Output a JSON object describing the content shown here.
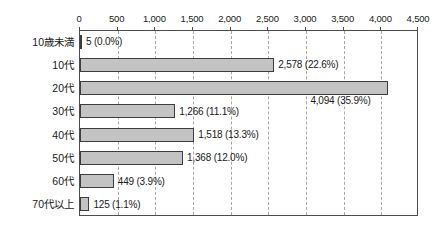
{
  "chart_data": {
    "type": "bar",
    "orientation": "horizontal",
    "title": "",
    "subtitle": "",
    "xlabel": "",
    "ylabel": "",
    "xlim": [
      0,
      4500
    ],
    "ylim": null,
    "grid": true,
    "grid_axis": "x",
    "legend": false,
    "legend_position": "none",
    "xticks": [
      0,
      500,
      1000,
      1500,
      2000,
      2500,
      3000,
      3500,
      4000,
      4500
    ],
    "xtick_labels": [
      "0",
      "500",
      "1,000",
      "1,500",
      "2,000",
      "2,500",
      "3,000",
      "3,500",
      "4,000",
      "4,500"
    ],
    "categories": [
      "10歳未満",
      "10代",
      "20代",
      "30代",
      "40代",
      "50代",
      "60代",
      "70代以上"
    ],
    "values": [
      5,
      2578,
      4094,
      1266,
      1518,
      1368,
      449,
      125
    ],
    "percents": [
      0.0,
      22.6,
      35.9,
      11.1,
      13.3,
      12.0,
      3.9,
      1.1
    ],
    "data_labels": [
      "5 (0.0%)",
      "2,578 (22.6%)",
      "4,094 (35.9%)",
      "1,266 (11.1%)",
      "1,518 (13.3%)",
      "1,368 (12.0%)",
      "449 (3.9%)",
      "125 (1.1%)"
    ],
    "data_label_positions": [
      "right",
      "right",
      "below-right",
      "right",
      "right",
      "right",
      "right",
      "right"
    ],
    "bar_fill_color": "#c3c3c3",
    "bar_border_color": "#3d3d3d",
    "gridline_color": "#a8a8a8",
    "axis_color": "#4d4d4d",
    "background_color": "#ffffff",
    "text_color": "#1a1a1a"
  }
}
